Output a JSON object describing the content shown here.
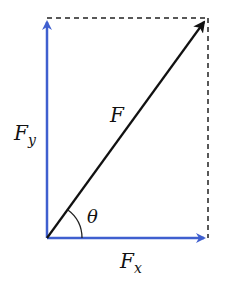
{
  "diagram": {
    "colors": {
      "resultant": "#111111",
      "components": "#3f5fcf",
      "guides": "#222222"
    },
    "origin": [
      47,
      238
    ],
    "resultant": {
      "label": "F",
      "tip": [
        208,
        18
      ]
    },
    "components": [
      {
        "label_main": "F",
        "label_sub": "y",
        "axis": "vertical",
        "tip": [
          47,
          18
        ]
      },
      {
        "label_main": "F",
        "label_sub": "x",
        "axis": "horizontal",
        "tip": [
          208,
          238
        ]
      }
    ],
    "angle": {
      "label": "θ",
      "between": [
        "F",
        "Fx"
      ]
    },
    "guides": [
      {
        "type": "dashed",
        "from": [
          47,
          18
        ],
        "to": [
          208,
          18
        ]
      },
      {
        "type": "dashed",
        "from": [
          208,
          18
        ],
        "to": [
          208,
          238
        ]
      }
    ]
  }
}
